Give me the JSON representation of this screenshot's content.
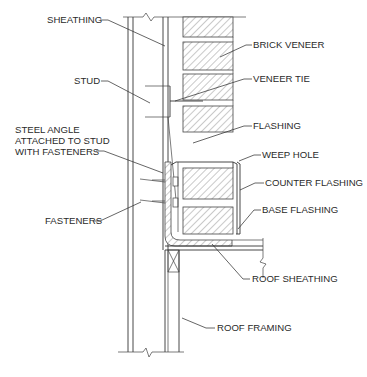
{
  "diagram": {
    "labels": [
      {
        "id": "sheathing",
        "text": "SHEATHING",
        "x": 47,
        "y": 23
      },
      {
        "id": "brick-veneer",
        "text": "BRICK VENEER",
        "x": 252,
        "y": 48
      },
      {
        "id": "stud",
        "text": "STUD",
        "x": 74,
        "y": 84
      },
      {
        "id": "veneer-tie",
        "text": "VENEER TIE",
        "x": 253,
        "y": 82
      },
      {
        "id": "flashing",
        "text": "FLASHING",
        "x": 253,
        "y": 129
      },
      {
        "id": "steel-angle-1",
        "text": "STEEL ANGLE",
        "x": 15,
        "y": 133
      },
      {
        "id": "steel-angle-2",
        "text": "ATTACHED TO STUD",
        "x": 15,
        "y": 144
      },
      {
        "id": "steel-angle-3",
        "text": "WITH FASTENERS",
        "x": 15,
        "y": 155
      },
      {
        "id": "weep-hole",
        "text": "WEEP HOLE",
        "x": 262,
        "y": 158
      },
      {
        "id": "counter-flashing",
        "text": "COUNTER FLASHING",
        "x": 265,
        "y": 186
      },
      {
        "id": "fasteners",
        "text": "FASTENERS",
        "x": 45,
        "y": 224
      },
      {
        "id": "base-flashing",
        "text": "BASE FLASHING",
        "x": 262,
        "y": 213
      },
      {
        "id": "roof-sheathing",
        "text": "ROOF SHEATHING",
        "x": 252,
        "y": 282
      },
      {
        "id": "roof-framing",
        "text": "ROOF FRAMING",
        "x": 217,
        "y": 331
      }
    ]
  }
}
